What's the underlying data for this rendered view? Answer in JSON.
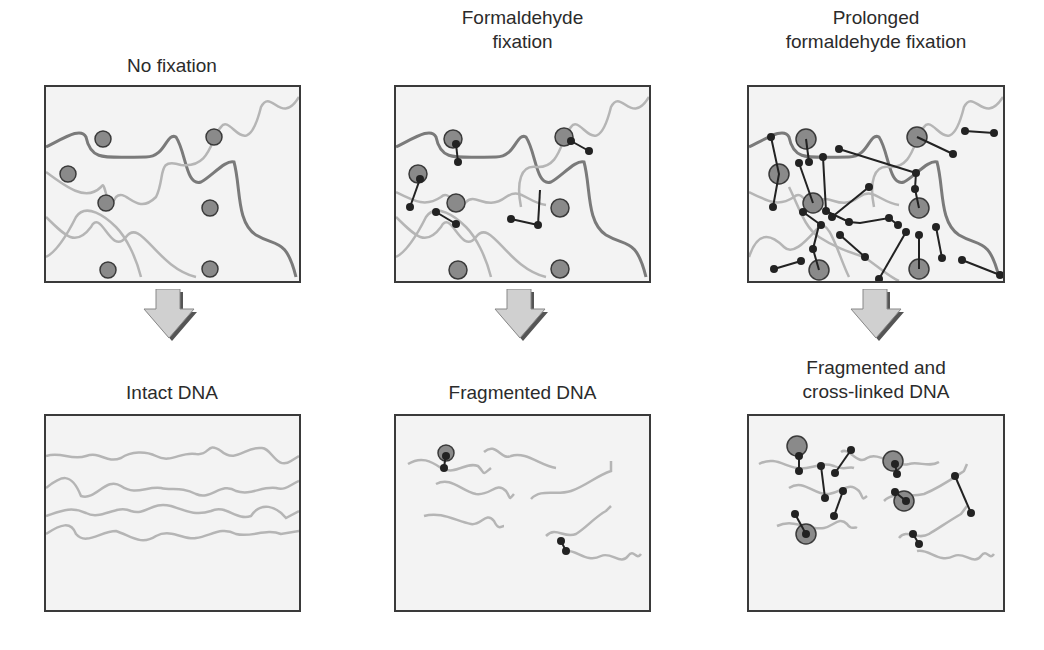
{
  "figure": {
    "columns": [
      {
        "top_label": "No fixation",
        "bottom_label": "Intact DNA"
      },
      {
        "top_label_line1": "Formaldehyde",
        "top_label_line2": "fixation",
        "bottom_label": "Fragmented DNA"
      },
      {
        "top_label_line1": "Prolonged",
        "top_label_line2": "formaldehyde fixation",
        "bottom_label_line1": "Fragmented and",
        "bottom_label_line2": "cross-linked DNA"
      }
    ],
    "colors": {
      "panel_bg": "#f3f3f3",
      "panel_border": "#3a3a3a",
      "dna_dark": "#7a7a7a",
      "dna_light": "#b5b5b5",
      "protein": "#8a8a8a",
      "crosslink": "#222222",
      "arrow_fill": "#d0d0d0",
      "arrow_shadow": "#555555"
    }
  }
}
